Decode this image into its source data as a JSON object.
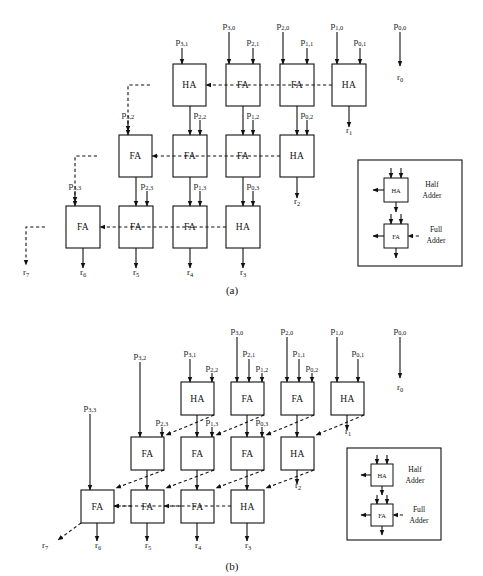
{
  "figure": {
    "captions": {
      "a": "(a)",
      "b": "(b)"
    },
    "colors": {
      "ink": "#111111",
      "paper": "#ffffff"
    }
  },
  "legend": {
    "half_adder": {
      "box_label": "HA",
      "line1": "Half",
      "line2": "Adder"
    },
    "full_adder": {
      "box_label": "FA",
      "line1": "Full",
      "line2": "Adder"
    }
  },
  "diagram_a": {
    "name": "carry-ripple-array",
    "rows": [
      {
        "row": 0,
        "cells": [
          {
            "id": "a-r0-c0",
            "type": "HA",
            "label": "HA",
            "x": 173,
            "y": 64,
            "w": 33,
            "h": 42
          },
          {
            "id": "a-r0-c1",
            "type": "FA",
            "label": "FA",
            "x": 226,
            "y": 64,
            "w": 34,
            "h": 42
          },
          {
            "id": "a-r0-c2",
            "type": "FA",
            "label": "FA",
            "x": 280,
            "y": 64,
            "w": 34,
            "h": 42
          },
          {
            "id": "a-r0-c3",
            "type": "HA",
            "label": "HA",
            "x": 332,
            "y": 64,
            "w": 34,
            "h": 42
          }
        ]
      },
      {
        "row": 1,
        "cells": [
          {
            "id": "a-r1-c0",
            "type": "FA",
            "label": "FA",
            "x": 119,
            "y": 135,
            "w": 33,
            "h": 42
          },
          {
            "id": "a-r1-c1",
            "type": "FA",
            "label": "FA",
            "x": 173,
            "y": 135,
            "w": 34,
            "h": 42
          },
          {
            "id": "a-r1-c2",
            "type": "FA",
            "label": "FA",
            "x": 226,
            "y": 135,
            "w": 34,
            "h": 42
          },
          {
            "id": "a-r1-c3",
            "type": "HA",
            "label": "HA",
            "x": 280,
            "y": 135,
            "w": 34,
            "h": 42
          }
        ]
      },
      {
        "row": 2,
        "cells": [
          {
            "id": "a-r2-c0",
            "type": "FA",
            "label": "FA",
            "x": 66,
            "y": 206,
            "w": 34,
            "h": 42
          },
          {
            "id": "a-r2-c1",
            "type": "FA",
            "label": "FA",
            "x": 119,
            "y": 206,
            "w": 34,
            "h": 42
          },
          {
            "id": "a-r2-c2",
            "type": "FA",
            "label": "FA",
            "x": 173,
            "y": 206,
            "w": 34,
            "h": 42
          },
          {
            "id": "a-r2-c3",
            "type": "HA",
            "label": "HA",
            "x": 226,
            "y": 206,
            "w": 34,
            "h": 42
          }
        ]
      }
    ],
    "inputs_top": [
      {
        "id": "a-p31",
        "base": "p",
        "sub": "3,1",
        "x": 182,
        "y": 44,
        "line_from": 48,
        "line_to": 64
      },
      {
        "id": "a-p30",
        "base": "p",
        "sub": "3,0",
        "x": 229,
        "y": 28,
        "line_from": 32,
        "line_to": 64
      },
      {
        "id": "a-p21",
        "base": "p",
        "sub": "2,1",
        "x": 253,
        "y": 44,
        "line_from": 48,
        "line_to": 64
      },
      {
        "id": "a-p20",
        "base": "p",
        "sub": "2,0",
        "x": 283,
        "y": 28,
        "line_from": 32,
        "line_to": 64
      },
      {
        "id": "a-p11",
        "base": "p",
        "sub": "1,1",
        "x": 307,
        "y": 44,
        "line_from": 48,
        "line_to": 64
      },
      {
        "id": "a-p10",
        "base": "p",
        "sub": "1,0",
        "x": 337,
        "y": 28,
        "line_from": 32,
        "line_to": 64
      },
      {
        "id": "a-p01",
        "base": "p",
        "sub": "0,1",
        "x": 360,
        "y": 44,
        "line_from": 48,
        "line_to": 64
      },
      {
        "id": "a-p00",
        "base": "p",
        "sub": "0,0",
        "x": 400,
        "y": 28,
        "line_from": 32,
        "line_to": 66
      }
    ],
    "inputs_mid": [
      {
        "id": "a-p32",
        "base": "p",
        "sub": "3,2",
        "x": 128,
        "y": 117,
        "line_from": 120,
        "line_to": 135
      },
      {
        "id": "a-p22",
        "base": "p",
        "sub": "2,2",
        "x": 200,
        "y": 117,
        "line_from": 120,
        "line_to": 135
      },
      {
        "id": "a-p12",
        "base": "p",
        "sub": "1,2",
        "x": 253,
        "y": 117,
        "line_from": 120,
        "line_to": 135
      },
      {
        "id": "a-p02",
        "base": "p",
        "sub": "0,2",
        "x": 307,
        "y": 117,
        "line_from": 120,
        "line_to": 135
      }
    ],
    "inputs_low": [
      {
        "id": "a-p33",
        "base": "p",
        "sub": "3,3",
        "x": 75,
        "y": 188,
        "line_from": 191,
        "line_to": 206
      },
      {
        "id": "a-p23",
        "base": "p",
        "sub": "2,3",
        "x": 147,
        "y": 188,
        "line_from": 191,
        "line_to": 206
      },
      {
        "id": "a-p13",
        "base": "p",
        "sub": "1,3",
        "x": 200,
        "y": 188,
        "line_from": 191,
        "line_to": 206
      },
      {
        "id": "a-p03",
        "base": "p",
        "sub": "0,3",
        "x": 253,
        "y": 188,
        "line_from": 191,
        "line_to": 206
      }
    ],
    "outputs": [
      {
        "id": "a-r0",
        "base": "r",
        "sub": "0",
        "x": 400,
        "y": 80
      },
      {
        "id": "a-r1",
        "base": "r",
        "sub": "1",
        "x": 349,
        "y": 133
      },
      {
        "id": "a-r2",
        "base": "r",
        "sub": "2",
        "x": 297,
        "y": 204
      },
      {
        "id": "a-r3",
        "base": "r",
        "sub": "3",
        "x": 243,
        "y": 275
      },
      {
        "id": "a-r4",
        "base": "r",
        "sub": "4",
        "x": 190,
        "y": 275
      },
      {
        "id": "a-r5",
        "base": "r",
        "sub": "5",
        "x": 136,
        "y": 275
      },
      {
        "id": "a-r6",
        "base": "r",
        "sub": "6",
        "x": 83,
        "y": 275
      },
      {
        "id": "a-r7",
        "base": "r",
        "sub": "7",
        "x": 26,
        "y": 275
      }
    ],
    "legend_panel": {
      "x": 358,
      "y": 160,
      "w": 104,
      "h": 106
    }
  },
  "diagram_b": {
    "name": "carry-save-array",
    "rows": [
      {
        "row": 0,
        "cells": [
          {
            "id": "b-r0-c0",
            "type": "HA",
            "label": "HA",
            "x": 181,
            "y": 382,
            "w": 33,
            "h": 33
          },
          {
            "id": "b-r0-c1",
            "type": "FA",
            "label": "FA",
            "x": 231,
            "y": 382,
            "w": 33,
            "h": 33
          },
          {
            "id": "b-r0-c2",
            "type": "FA",
            "label": "FA",
            "x": 281,
            "y": 382,
            "w": 33,
            "h": 33
          },
          {
            "id": "b-r0-c3",
            "type": "HA",
            "label": "HA",
            "x": 331,
            "y": 382,
            "w": 33,
            "h": 33
          }
        ]
      },
      {
        "row": 1,
        "cells": [
          {
            "id": "b-r1-c0",
            "type": "FA",
            "label": "FA",
            "x": 131,
            "y": 437,
            "w": 33,
            "h": 33
          },
          {
            "id": "b-r1-c1",
            "type": "FA",
            "label": "FA",
            "x": 181,
            "y": 437,
            "w": 33,
            "h": 33
          },
          {
            "id": "b-r1-c2",
            "type": "FA",
            "label": "FA",
            "x": 231,
            "y": 437,
            "w": 33,
            "h": 33
          },
          {
            "id": "b-r1-c3",
            "type": "HA",
            "label": "HA",
            "x": 281,
            "y": 437,
            "w": 33,
            "h": 33
          }
        ]
      },
      {
        "row": 2,
        "cells": [
          {
            "id": "b-r2-c0",
            "type": "FA",
            "label": "FA",
            "x": 81,
            "y": 490,
            "w": 33,
            "h": 33
          },
          {
            "id": "b-r2-c1",
            "type": "FA",
            "label": "FA",
            "x": 131,
            "y": 490,
            "w": 33,
            "h": 33
          },
          {
            "id": "b-r2-c2",
            "type": "FA",
            "label": "FA",
            "x": 181,
            "y": 490,
            "w": 33,
            "h": 33
          },
          {
            "id": "b-r2-c3",
            "type": "HA",
            "label": "HA",
            "x": 231,
            "y": 490,
            "w": 33,
            "h": 33
          }
        ]
      }
    ],
    "inputs_top": [
      {
        "id": "b-p31",
        "base": "p",
        "sub": "3,1",
        "x": 190,
        "y": 355,
        "line_from": 359,
        "line_to": 382
      },
      {
        "id": "b-p22",
        "base": "p",
        "sub": "2,2",
        "x": 212,
        "y": 370,
        "line_from": 373,
        "line_to": 382
      },
      {
        "id": "b-p30",
        "base": "p",
        "sub": "3,0",
        "x": 237,
        "y": 333,
        "line_from": 337,
        "line_to": 382
      },
      {
        "id": "b-p21",
        "base": "p",
        "sub": "2,1",
        "x": 249,
        "y": 355,
        "line_from": 359,
        "line_to": 382
      },
      {
        "id": "b-p12",
        "base": "p",
        "sub": "1,2",
        "x": 262,
        "y": 370,
        "line_from": 373,
        "line_to": 382
      },
      {
        "id": "b-p20",
        "base": "p",
        "sub": "2,0",
        "x": 287,
        "y": 333,
        "line_from": 337,
        "line_to": 382
      },
      {
        "id": "b-p11",
        "base": "p",
        "sub": "1,1",
        "x": 299,
        "y": 355,
        "line_from": 359,
        "line_to": 382
      },
      {
        "id": "b-p02",
        "base": "p",
        "sub": "0,2",
        "x": 312,
        "y": 370,
        "line_from": 373,
        "line_to": 382
      },
      {
        "id": "b-p10",
        "base": "p",
        "sub": "1,0",
        "x": 337,
        "y": 333,
        "line_from": 337,
        "line_to": 382
      },
      {
        "id": "b-p01",
        "base": "p",
        "sub": "0,1",
        "x": 358,
        "y": 355,
        "line_from": 359,
        "line_to": 382
      },
      {
        "id": "b-p00",
        "base": "p",
        "sub": "0,0",
        "x": 400,
        "y": 333,
        "line_from": 337,
        "line_to": 378
      }
    ],
    "inputs_left": [
      {
        "id": "b-p32",
        "base": "p",
        "sub": "3,2",
        "x": 140,
        "y": 358,
        "line_from": 362,
        "line_to": 437
      },
      {
        "id": "b-p23",
        "base": "p",
        "sub": "2,3",
        "x": 162,
        "y": 424,
        "line_from": 427,
        "line_to": 437
      },
      {
        "id": "b-p13",
        "base": "p",
        "sub": "1,3",
        "x": 212,
        "y": 424,
        "line_from": 427,
        "line_to": 437
      },
      {
        "id": "b-p03",
        "base": "p",
        "sub": "0,3",
        "x": 262,
        "y": 424,
        "line_from": 427,
        "line_to": 437
      },
      {
        "id": "b-p33",
        "base": "p",
        "sub": "3,3",
        "x": 90,
        "y": 410,
        "line_from": 414,
        "line_to": 490
      }
    ],
    "outputs": [
      {
        "id": "b-r0",
        "base": "r",
        "sub": "0",
        "x": 400,
        "y": 390
      },
      {
        "id": "b-r1",
        "base": "r",
        "sub": "1",
        "x": 348,
        "y": 434
      },
      {
        "id": "b-r2",
        "base": "r",
        "sub": "2",
        "x": 298,
        "y": 488
      },
      {
        "id": "b-r3",
        "base": "r",
        "sub": "3",
        "x": 248,
        "y": 548
      },
      {
        "id": "b-r4",
        "base": "r",
        "sub": "4",
        "x": 198,
        "y": 548
      },
      {
        "id": "b-r5",
        "base": "r",
        "sub": "5",
        "x": 148,
        "y": 548
      },
      {
        "id": "b-r6",
        "base": "r",
        "sub": "6",
        "x": 98,
        "y": 548
      },
      {
        "id": "b-r7",
        "base": "r",
        "sub": "7",
        "x": 45,
        "y": 548
      }
    ],
    "legend_panel": {
      "x": 347,
      "y": 448,
      "w": 94,
      "h": 92
    }
  },
  "caption_positions": {
    "a": {
      "x": 232,
      "y": 294
    },
    "b": {
      "x": 232,
      "y": 570
    }
  }
}
